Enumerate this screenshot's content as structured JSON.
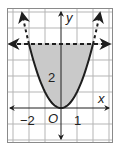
{
  "chart_data": {
    "type": "line",
    "title": "",
    "xlabel": "x",
    "ylabel": "y",
    "origin_label": "O",
    "xlim": [
      -3,
      3
    ],
    "ylim": [
      -2,
      6
    ],
    "grid": true,
    "grid_step": 1,
    "tick_labels": {
      "x": [
        {
          "value": -2,
          "label": "−2"
        },
        {
          "value": 1,
          "label": "1"
        }
      ],
      "y": [
        {
          "value": 2,
          "label": "2"
        }
      ]
    },
    "series": [
      {
        "name": "parabola",
        "equation": "y = x^2",
        "style": "solid within shaded region, dashed beyond y = 4",
        "arrows": "both ends",
        "x_range": [
          -2.43,
          2.43
        ]
      },
      {
        "name": "boundary-line",
        "equation": "y = 4",
        "style": "dashed",
        "arrows": "both ends"
      }
    ],
    "shaded_region": {
      "description": "between y = x^2 and y = 4",
      "inequality": "x^2 <= y <= 4",
      "color": "#c9c9c9"
    }
  },
  "colors": {
    "grid": "#b5b5b5",
    "frame": "#8a8a8a",
    "curve": "#1e1e1e",
    "shade": "#c9c9c9"
  }
}
